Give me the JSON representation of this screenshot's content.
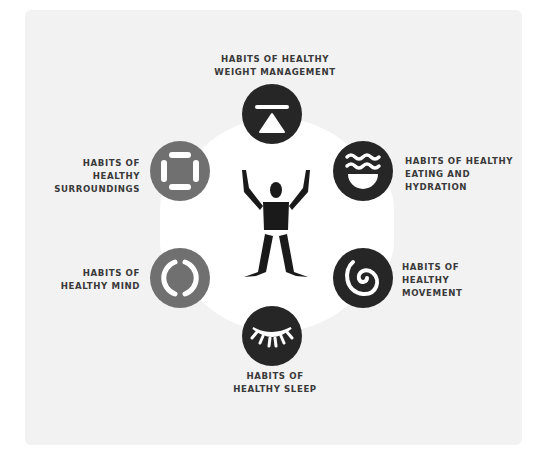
{
  "diagram": {
    "center": {
      "icon": "person-arms-raised-icon"
    },
    "nodes": [
      {
        "id": "weight",
        "lines": [
          "HABITS OF HEALTHY",
          "WEIGHT MANAGEMENT"
        ],
        "icon": "scale-triangle-icon",
        "color": "#262626"
      },
      {
        "id": "eating",
        "lines": [
          "HABITS OF HEALTHY",
          "EATING AND",
          "HYDRATION"
        ],
        "icon": "bowl-waves-icon",
        "color": "#262626"
      },
      {
        "id": "movement",
        "lines": [
          "HABITS OF",
          "HEALTHY",
          "MOVEMENT"
        ],
        "icon": "spiral-icon",
        "color": "#262626"
      },
      {
        "id": "sleep",
        "lines": [
          "HABITS OF",
          "HEALTHY SLEEP"
        ],
        "icon": "closed-eye-icon",
        "color": "#262626"
      },
      {
        "id": "mind",
        "lines": [
          "HABITS OF",
          "HEALTHY MIND"
        ],
        "icon": "brackets-circle-icon",
        "color": "#707070"
      },
      {
        "id": "surroundings",
        "lines": [
          "HABITS OF",
          "HEALTHY",
          "SURROUNDINGS"
        ],
        "icon": "framed-square-icon",
        "color": "#707070"
      }
    ]
  }
}
